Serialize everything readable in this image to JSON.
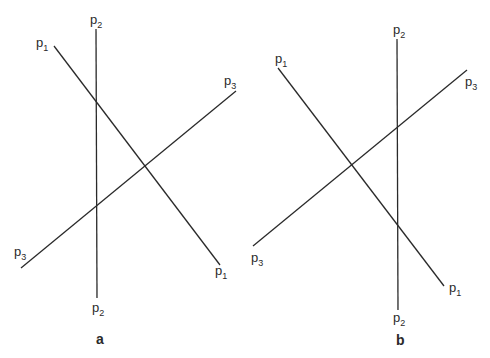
{
  "figure": {
    "panels": [
      {
        "id": "a",
        "label": "a",
        "lines": [
          {
            "name": "p1",
            "label": "p",
            "sub": "1",
            "x1": 54,
            "y1": 46,
            "x2": 220,
            "y2": 265
          },
          {
            "name": "p2",
            "label": "p",
            "sub": "2",
            "x1": 96,
            "y1": 29,
            "x2": 97,
            "y2": 298
          },
          {
            "name": "p3",
            "label": "p",
            "sub": "3",
            "x1": 236,
            "y1": 91,
            "x2": 21,
            "y2": 268
          }
        ]
      },
      {
        "id": "b",
        "label": "b",
        "lines": [
          {
            "name": "p1",
            "label": "p",
            "sub": "1",
            "x1": 278,
            "y1": 68,
            "x2": 444,
            "y2": 286
          },
          {
            "name": "p2",
            "label": "p",
            "sub": "2",
            "x1": 397,
            "y1": 39,
            "x2": 398,
            "y2": 310
          },
          {
            "name": "p3",
            "label": "p",
            "sub": "3",
            "x1": 467,
            "y1": 70,
            "x2": 253,
            "y2": 246
          }
        ]
      }
    ]
  }
}
